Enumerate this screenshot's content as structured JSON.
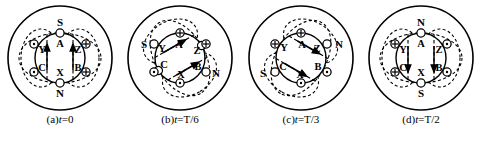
{
  "figure": {
    "title": "",
    "type": "three-phase-rotating-magnetic-field-diagram",
    "panel_count": 4,
    "symbols": {
      "current_in": "cross-in-circle",
      "current_out": "dot-in-circle",
      "pole_blank": "open-circle"
    },
    "colors": {
      "stroke": "#000000",
      "background": "#ffffff"
    }
  },
  "panels": [
    {
      "id": "a",
      "caption_prefix": "(a)",
      "caption_var": "t",
      "caption_eq": "=0",
      "caption_full": "(a)t=0",
      "field_angle_deg": 0,
      "labels": {
        "top_pole": "S",
        "bottom_pole": "N"
      },
      "coils": [
        {
          "name": "A",
          "label": "A",
          "marker": "none"
        },
        {
          "name": "X",
          "label": "X",
          "marker": "none"
        },
        {
          "name": "Y",
          "label": "Y",
          "marker": "dot"
        },
        {
          "name": "B",
          "label": "B",
          "marker": "cross"
        },
        {
          "name": "C",
          "label": "C",
          "marker": "dot"
        },
        {
          "name": "Z",
          "label": "Z",
          "marker": "cross"
        }
      ]
    },
    {
      "id": "b",
      "caption_prefix": "(b)",
      "caption_var": "t",
      "caption_eq": "=T/6",
      "caption_full": "(b)t=T/6",
      "field_angle_deg": 60,
      "labels": {
        "top_pole": "S",
        "bottom_pole": "N"
      },
      "coils": [
        {
          "name": "A",
          "label": "A",
          "marker": "cross"
        },
        {
          "name": "X",
          "label": "X",
          "marker": "dot"
        },
        {
          "name": "Y",
          "label": "Y",
          "marker": "none"
        },
        {
          "name": "B",
          "label": "B",
          "marker": "none"
        },
        {
          "name": "C",
          "label": "C",
          "marker": "dot"
        },
        {
          "name": "Z",
          "label": "Z",
          "marker": "cross"
        }
      ]
    },
    {
      "id": "c",
      "caption_prefix": "(c)",
      "caption_var": "t",
      "caption_eq": "=T/3",
      "caption_full": "(c)t=T/3",
      "field_angle_deg": 120,
      "labels": {
        "top_pole": "N",
        "bottom_pole": "S"
      },
      "coils": [
        {
          "name": "A",
          "label": "A",
          "marker": "cross"
        },
        {
          "name": "X",
          "label": "X",
          "marker": "dot"
        },
        {
          "name": "Y",
          "label": "Y",
          "marker": "cross"
        },
        {
          "name": "B",
          "label": "B",
          "marker": "dot"
        },
        {
          "name": "C",
          "label": "C",
          "marker": "none"
        },
        {
          "name": "Z",
          "label": "Z",
          "marker": "none"
        }
      ]
    },
    {
      "id": "d",
      "caption_prefix": "(d)",
      "caption_var": "t",
      "caption_eq": "=T/2",
      "caption_full": "(d)t=T/2",
      "field_angle_deg": 180,
      "labels": {
        "top_pole": "N",
        "bottom_pole": "S"
      },
      "coils": [
        {
          "name": "A",
          "label": "A",
          "marker": "none"
        },
        {
          "name": "X",
          "label": "X",
          "marker": "none"
        },
        {
          "name": "Y",
          "label": "Y",
          "marker": "cross"
        },
        {
          "name": "B",
          "label": "B",
          "marker": "dot"
        },
        {
          "name": "C",
          "label": "C",
          "marker": "cross"
        },
        {
          "name": "Z",
          "label": "Z",
          "marker": "dot"
        }
      ]
    }
  ]
}
